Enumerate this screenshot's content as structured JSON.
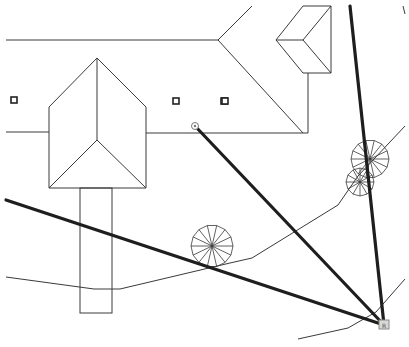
{
  "canvas": {
    "width": 409,
    "height": 347,
    "background": "#ffffff"
  },
  "drawing": {
    "type": "site-plan",
    "colors": {
      "linework": "#3a3a3a",
      "sightlines": "#1e1e1e",
      "station_fill": "#d8d8d8"
    },
    "main_building": {
      "outline": [
        [
          6,
          40
        ],
        [
          218,
          40
        ],
        [
          252,
          6
        ]
      ],
      "hip_lines": [
        [
          [
            218,
            40
          ],
          [
            303,
            133
          ]
        ]
      ],
      "eave_left": [
        [
          6,
          132
        ],
        [
          49,
          132
        ]
      ],
      "eave_right": [
        [
          146,
          133
        ],
        [
          303,
          133
        ],
        [
          308,
          133
        ],
        [
          308,
          73
        ]
      ]
    },
    "left_wing": {
      "peak": [
        97,
        58
      ],
      "left_corner": [
        49,
        107
      ],
      "right_corner": [
        146,
        107
      ],
      "valley": [
        97,
        140
      ],
      "bottom_y": 188
    },
    "walkway": {
      "x": 80,
      "y": 188,
      "w": 32,
      "h": 125
    },
    "dormer": {
      "points": [
        [
          276,
          40
        ],
        [
          303,
          6
        ],
        [
          331,
          6
        ],
        [
          331,
          73
        ],
        [
          303,
          73
        ]
      ],
      "inner": [
        [
          276,
          40
        ],
        [
          303,
          40
        ],
        [
          331,
          6
        ]
      ],
      "inner2": [
        [
          303,
          40
        ],
        [
          331,
          73
        ]
      ]
    },
    "markers": [
      {
        "name": "vent-1",
        "x": 14,
        "y": 100
      },
      {
        "name": "vent-2",
        "x": 176,
        "y": 101
      },
      {
        "name": "vent-3",
        "x": 224,
        "y": 101
      },
      {
        "name": "vent-4",
        "x": 225,
        "y": 101
      }
    ],
    "control_points": [
      {
        "name": "target-point",
        "x": 195,
        "y": 126
      },
      {
        "name": "instrument-station",
        "x": 384,
        "y": 325,
        "label": "R"
      }
    ],
    "sightlines": [
      {
        "from": [
          195,
          126
        ],
        "to": [
          384,
          325
        ]
      },
      {
        "from": [
          6,
          200
        ],
        "to": [
          384,
          325
        ]
      },
      {
        "from": [
          350,
          6
        ],
        "to": [
          384,
          325
        ]
      }
    ],
    "contours": [
      [
        [
          6,
          277
        ],
        [
          94,
          289
        ],
        [
          120,
          289
        ],
        [
          230,
          263
        ],
        [
          252,
          258
        ],
        [
          338,
          205
        ],
        [
          358,
          176
        ],
        [
          405,
          126
        ]
      ],
      [
        [
          298,
          339
        ],
        [
          348,
          328
        ],
        [
          376,
          312
        ],
        [
          405,
          279
        ]
      ]
    ],
    "trees": [
      {
        "cx": 212,
        "cy": 246,
        "r": 21,
        "spokes": 14
      },
      {
        "cx": 370,
        "cy": 159,
        "r": 19,
        "spokes": 14
      },
      {
        "cx": 360,
        "cy": 182,
        "r": 14,
        "spokes": 12
      }
    ],
    "tick": {
      "x1": 403,
      "y1": 6,
      "x2": 405,
      "y2": 14
    }
  }
}
